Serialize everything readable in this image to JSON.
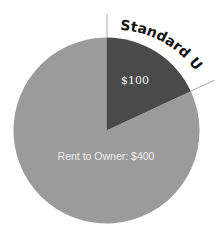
{
  "chart_data": {
    "type": "pie",
    "title": "",
    "categories": [
      "Standard UA",
      "Rent to Owner"
    ],
    "values": [
      100,
      400
    ],
    "labels": [
      "$100",
      "Rent to Owner: $400"
    ],
    "callout": "Standard UA",
    "colors": [
      "#4a4a4a",
      "#9b9b9b"
    ],
    "start_angle_deg": 0,
    "legend": "none"
  },
  "labels": {
    "standard_ua_value": "$100",
    "rent_value": "Rent to Owner: $400",
    "callout": "Standard UA"
  }
}
